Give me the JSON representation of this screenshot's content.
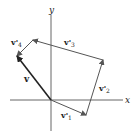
{
  "diagram": {
    "axes": {
      "x_label": "x",
      "y_label": "y"
    },
    "vectors": {
      "v": "v",
      "v1": "v'",
      "v1_sub": "1",
      "v2": "v'",
      "v2_sub": "2",
      "v3": "v'",
      "v3_sub": "3",
      "v4": "v'",
      "v4_sub": "4"
    },
    "colors": {
      "axis": "#555555",
      "polygon": "#555555",
      "v_arrow": "#222222"
    }
  }
}
